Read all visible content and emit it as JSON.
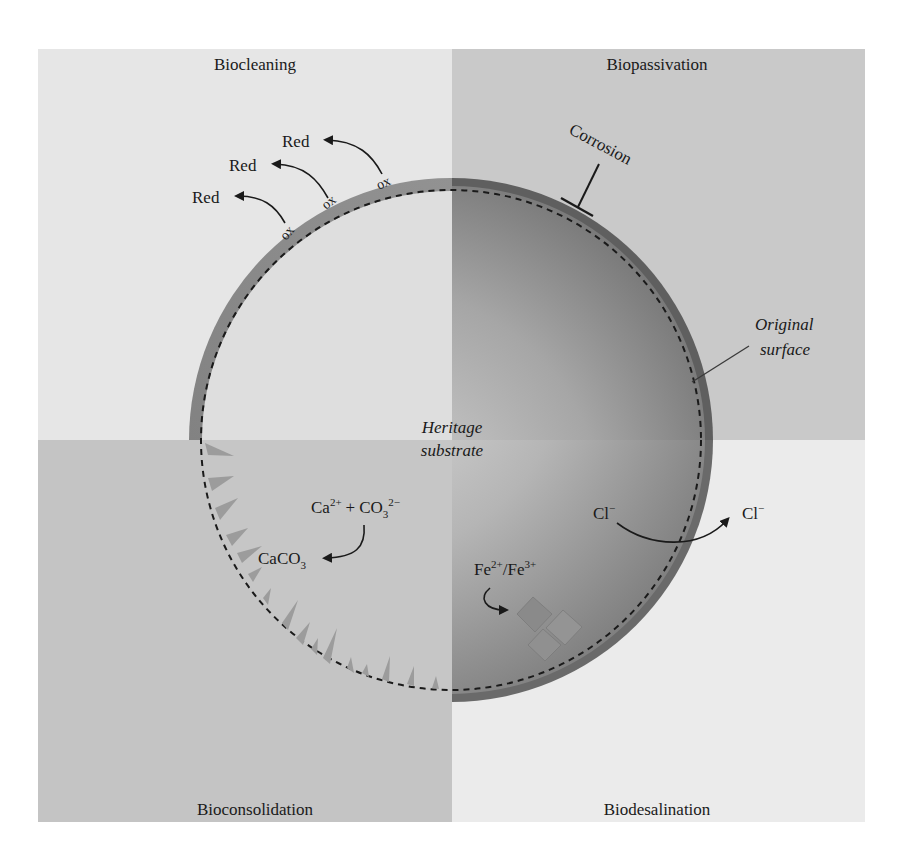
{
  "quadrants": {
    "top_left": {
      "title": "Biocleaning",
      "color": "#e6e6e6"
    },
    "top_right": {
      "title": "Biopassivation",
      "color": "#c9c9c9"
    },
    "bottom_left": {
      "title": "Bioconsolidation",
      "color": "#c4c4c4"
    },
    "bottom_right": {
      "title": "Biodesalination",
      "color": "#ebebeb"
    }
  },
  "center": {
    "line1": "Heritage",
    "line2": "substrate"
  },
  "biocleaning": {
    "reduced_label": "Red",
    "oxidized_label": "ox",
    "count": 3
  },
  "biopassivation": {
    "inhibited_label": "Corrosion",
    "surface_line1": "Original",
    "surface_line2": "surface"
  },
  "bioconsolidation": {
    "reactant_ca": "Ca",
    "reactant_ca_charge": "2+",
    "plus": "+",
    "reactant_co": "CO",
    "reactant_co_sub": "3",
    "reactant_co_charge": "2−",
    "product": "CaCO",
    "product_sub": "3"
  },
  "biodesalination": {
    "ion_inside": "Cl",
    "ion_inside_charge": "−",
    "ion_outside": "Cl",
    "ion_outside_charge": "−",
    "iron_a": "Fe",
    "iron_a_charge": "2+",
    "iron_sep": "/Fe",
    "iron_b_charge": "3+"
  },
  "colors": {
    "band_dark": "#6e6e6e",
    "band_light": "#a8a8a8",
    "inner_light": "#d8d8d8",
    "inner_dark": "#7a7a7a",
    "text": "#1a1a1a",
    "crystal": "#8f8f8f"
  }
}
